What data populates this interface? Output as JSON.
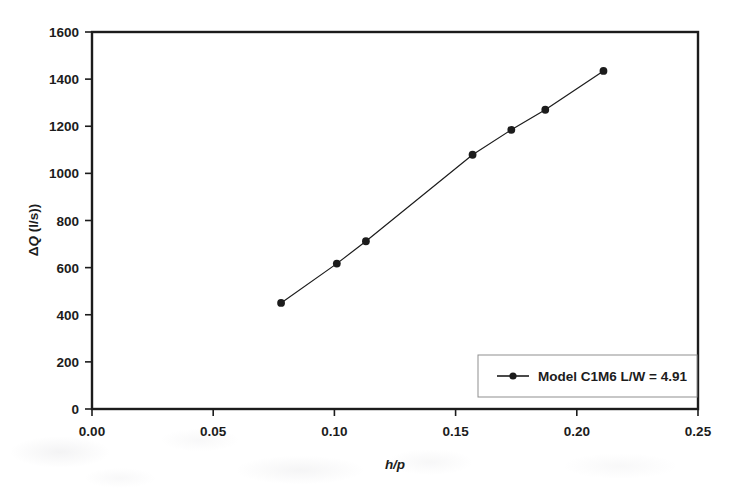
{
  "figure": {
    "background_color": "#ffffff",
    "ink_color": "#1c1c1c",
    "frame_color": "#1c1c1c"
  },
  "chart_data": {
    "type": "line",
    "title": "",
    "subtitle": "",
    "xlabel": "h/p",
    "ylabel": "ΔQ (l/s))",
    "xlim": [
      0.0,
      0.25
    ],
    "ylim": [
      0,
      1600
    ],
    "xticks": [
      0.0,
      0.05,
      0.1,
      0.15,
      0.2,
      0.25
    ],
    "xtick_labels": [
      "0.00",
      "0.05",
      "0.10",
      "0.15",
      "0.20",
      "0.25"
    ],
    "yticks": [
      0,
      200,
      400,
      600,
      800,
      1000,
      1200,
      1400,
      1600
    ],
    "ytick_labels": [
      "0",
      "200",
      "400",
      "600",
      "800",
      "1000",
      "1200",
      "1400",
      "1600"
    ],
    "grid": false,
    "frame": "box",
    "tick_direction": "out",
    "legend_position": "lower right",
    "marker": "filled-circle",
    "marker_size": 5,
    "line_width": 1.2,
    "series": [
      {
        "name": "Model C1M6 L/W = 4.91",
        "color": "#1c1c1c",
        "x": [
          0.078,
          0.101,
          0.113,
          0.157,
          0.173,
          0.187,
          0.211
        ],
        "values": [
          450,
          617,
          712,
          1079,
          1185,
          1270,
          1435
        ]
      }
    ],
    "annotations": []
  },
  "legend": {
    "entries": [
      {
        "label": "Model C1M6 L/W = 4.91",
        "marker": "line-with-circle",
        "color": "#1c1c1c"
      }
    ]
  },
  "axis_labels": {
    "y_title_parts": {
      "delta": "Δ",
      "quantity": "Q",
      "units": " (l/s))"
    },
    "x_title": "h/p"
  }
}
